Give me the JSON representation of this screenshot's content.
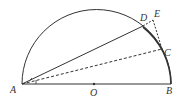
{
  "diagram": {
    "type": "geometry-semicircle",
    "points": {
      "A": {
        "label": "A",
        "x": 22,
        "y": 84
      },
      "B": {
        "label": "B",
        "x": 171,
        "y": 84
      },
      "O": {
        "label": "O",
        "x": 96,
        "y": 84
      },
      "C": {
        "label": "C",
        "x": 162,
        "y": 49
      },
      "D": {
        "label": "D",
        "x": 143,
        "y": 26
      },
      "E": {
        "label": "E",
        "x": 153,
        "y": 20
      }
    },
    "labels": {
      "A": "A",
      "B": "B",
      "O": "O",
      "C": "C",
      "D": "D",
      "E": "E"
    },
    "segments": [
      {
        "from": "A",
        "to": "B",
        "style": "solid"
      },
      {
        "from": "A",
        "to": "D",
        "style": "solid"
      },
      {
        "from": "A",
        "to": "C",
        "style": "dashed"
      },
      {
        "from": "D",
        "to": "E",
        "style": "dashed"
      },
      {
        "from": "E",
        "to": "C",
        "style": "dashed"
      },
      {
        "from": "D",
        "to": "C",
        "style": "solid-arc"
      },
      {
        "from": "C",
        "to": "B",
        "style": "solid-arc"
      }
    ],
    "arcs": [
      {
        "name": "semicircle",
        "center": "O",
        "radius": 75
      }
    ],
    "angle_marks": [
      {
        "vertex": "A",
        "between": [
          "AC",
          "AD"
        ]
      },
      {
        "vertex": "A",
        "between": [
          "AB",
          "AC"
        ]
      }
    ]
  }
}
